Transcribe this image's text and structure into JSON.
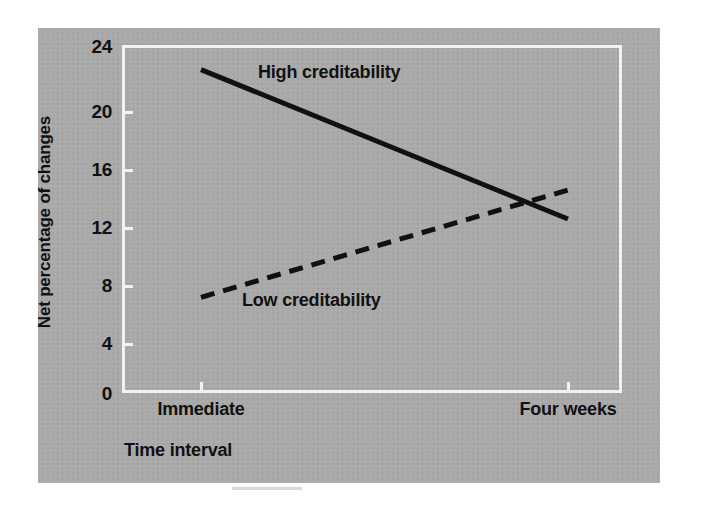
{
  "figure": {
    "panel_color": "#a9a9a9",
    "axis_color": "#f2f2f2",
    "ink_color": "#111111"
  },
  "chart_data": {
    "type": "line",
    "title": "",
    "xlabel": "Time interval",
    "ylabel": "Net percentage of changes",
    "categories": [
      "Immediate",
      "Four weeks"
    ],
    "x": [
      0,
      1
    ],
    "xlim": [
      0,
      1
    ],
    "ylim": [
      0,
      24
    ],
    "yticks": [
      0,
      4,
      8,
      12,
      16,
      20,
      24
    ],
    "ytick_labels": [
      "0",
      "4",
      "8",
      "12",
      "16",
      "20",
      "24"
    ],
    "grid": false,
    "legend_position": "inline-annotations",
    "series": [
      {
        "name": "High creditability",
        "style": "solid",
        "color": "#111111",
        "values": [
          22.3,
          12.0
        ]
      },
      {
        "name": "Low creditability",
        "style": "dashed",
        "color": "#111111",
        "values": [
          6.6,
          14.0
        ]
      }
    ],
    "annotations": [
      {
        "text": "High creditability",
        "series": "High creditability"
      },
      {
        "text": "Low creditability",
        "series": "Low creditability"
      }
    ]
  },
  "axes": {
    "y_title": "Net percentage of changes",
    "x_title": "Time interval",
    "y_ticks": [
      {
        "value": "24"
      },
      {
        "value": "20"
      },
      {
        "value": "16"
      },
      {
        "value": "12"
      },
      {
        "value": "8"
      },
      {
        "value": "4"
      },
      {
        "value": "0"
      }
    ],
    "x_ticks": [
      {
        "label": "Immediate"
      },
      {
        "label": "Four weeks"
      }
    ]
  }
}
